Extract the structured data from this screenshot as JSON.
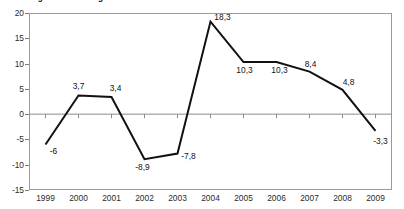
{
  "chart_data": {
    "type": "line",
    "title": "Abbildung 2: Veränderung BIP  1999-2009 in %",
    "subtitle": "",
    "xlabel": "",
    "ylabel": "",
    "categories": [
      "1999",
      "2000",
      "2001",
      "2002",
      "2003",
      "2004",
      "2005",
      "2006",
      "2007",
      "2008",
      "2009"
    ],
    "values": [
      -6,
      3.7,
      3.4,
      -8.9,
      -7.8,
      18.3,
      10.3,
      10.3,
      8.4,
      4.8,
      -3.3
    ],
    "point_labels": [
      "-6",
      "3,7",
      "3,4",
      "-8,9",
      "-7,8",
      "18,3",
      "10,3",
      "10,3",
      "8,4",
      "4,8",
      "-3,3"
    ],
    "ylim": [
      -15,
      20
    ],
    "ytick_step": 5,
    "ytick_labels": [
      "20",
      "15",
      "10",
      "5",
      "0",
      "-5",
      "-10",
      "-15"
    ],
    "ytick_values": [
      20,
      15,
      10,
      5,
      0,
      -5,
      -10,
      -15
    ],
    "grid": false,
    "legend": false,
    "legend_position": "none",
    "zero_line": true,
    "series_color": "#111111",
    "axis_color": "#9a9a9a",
    "zero_line_color": "#8c8c8c",
    "background_color": "#ffffff"
  },
  "labels": {
    "y0": "20",
    "y1": "15",
    "y2": "10",
    "y3": "5",
    "y4": "0",
    "y5": "-5",
    "y6": "-10",
    "y7": "-15"
  }
}
